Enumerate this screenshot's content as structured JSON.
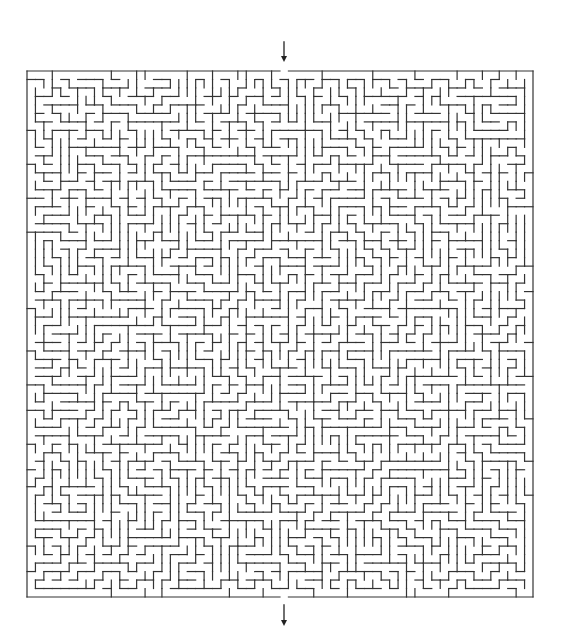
{
  "maze": {
    "cols": 60,
    "rows": 62,
    "left": 27,
    "top": 71,
    "width": 506,
    "height": 526,
    "entrance_col": 30,
    "exit_col": 30,
    "wall_color": "#333333",
    "wall_width": 1.2,
    "seed": 1337
  },
  "arrows": {
    "start": {
      "x": 284,
      "y1": 42,
      "y2": 62,
      "direction": "down",
      "label": "start-arrow"
    },
    "end": {
      "x": 284,
      "y1": 605,
      "y2": 626,
      "direction": "down",
      "label": "end-arrow"
    },
    "color": "#222222"
  }
}
